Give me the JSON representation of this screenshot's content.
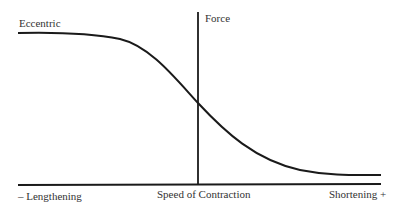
{
  "diagram": {
    "labels": {
      "curve_start": "Eccentric",
      "y_axis": "Force",
      "x_axis_left": "– Lengthening",
      "x_axis_center": "Speed of Contraction",
      "x_axis_right": "Shortening +"
    },
    "colors": {
      "line": "#1a1a1a",
      "background": "#ffffff",
      "text": "#333333"
    },
    "geometry": {
      "x_axis": {
        "x1": 18,
        "y1": 185,
        "x2": 381,
        "y2": 184
      },
      "y_axis": {
        "x1": 198,
        "y1": 12,
        "x2": 198,
        "y2": 185
      },
      "curve_path": "M18,33 C60,32 90,33 120,39 C150,46 175,78 198,103 C225,132 255,160 300,170 C330,176 355,175 381,175"
    }
  }
}
